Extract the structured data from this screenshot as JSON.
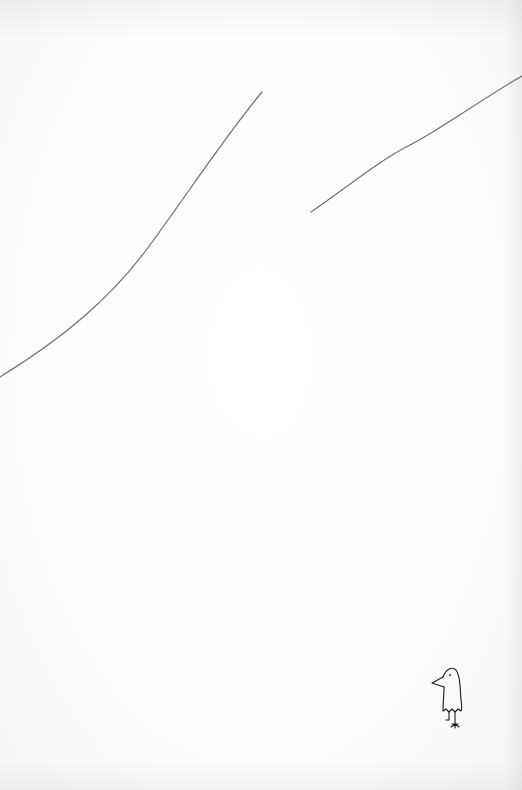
{
  "page": {
    "background_color": "#fbfbfb",
    "line_color": "#6e6e6e",
    "ink_color": "#1a1a1a"
  },
  "illustration": {
    "hill_lines": [
      {
        "name": "left-hill-line",
        "start": [
          0,
          377
        ],
        "end": [
          262,
          92
        ]
      },
      {
        "name": "right-hill-line",
        "start": [
          311,
          212
        ],
        "end": [
          522,
          76
        ]
      }
    ],
    "bird": {
      "position": [
        431,
        667
      ],
      "width": 32,
      "height": 62
    }
  }
}
